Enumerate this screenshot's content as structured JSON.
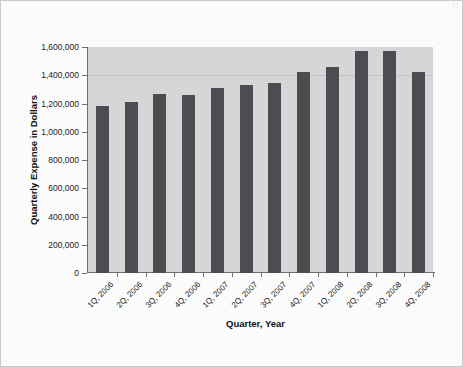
{
  "chart_data": {
    "type": "bar",
    "title": "",
    "subtitle": "",
    "xlabel": "Quarter, Year",
    "ylabel": "Quarterly Expense in Dollars",
    "categories": [
      "1Q, 2006",
      "2Q, 2006",
      "3Q, 2006",
      "4Q, 2006",
      "1Q, 2007",
      "2Q, 2007",
      "3Q, 2007",
      "4Q, 2007",
      "1Q, 2008",
      "2Q, 2008",
      "3Q, 2008",
      "4Q, 2008"
    ],
    "values": [
      1180000,
      1212000,
      1265000,
      1262000,
      1312000,
      1330000,
      1348000,
      1422000,
      1460000,
      1575000,
      1572000,
      1420000
    ],
    "ylim": [
      0,
      1600000
    ],
    "ytick_values": [
      0,
      200000,
      400000,
      600000,
      800000,
      1000000,
      1200000,
      1400000,
      1600000
    ],
    "ytick_labels": [
      "0",
      "200,000",
      "400,000",
      "600,000",
      "800,000",
      "1,000,000",
      "1,200,000",
      "1,400,000",
      "1,600,000"
    ],
    "grid": "horizontal-faint-at-1400000",
    "gridline_values": [
      1400000
    ],
    "legend": null,
    "legend_position": "none",
    "bar_color": "#4c4c53",
    "plot_background_color": "#d6d6d6",
    "figure_background_color": "#fbfbfb",
    "axis_color": "#6f6f6f"
  },
  "artifact": {
    "bleed_text": "|)"
  }
}
